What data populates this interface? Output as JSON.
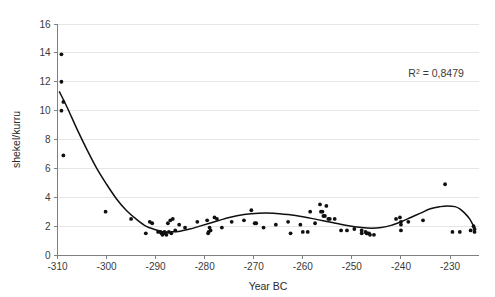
{
  "chart_data": {
    "type": "scatter",
    "title": "",
    "xlabel": "Year BC",
    "ylabel": "shekel/kurru",
    "xlim": [
      -312,
      -224
    ],
    "ylim": [
      0,
      16
    ],
    "grid": true,
    "legend": false,
    "xticks": [
      -310,
      -300,
      -290,
      -280,
      -270,
      -260,
      -250,
      -240,
      -230
    ],
    "xtick_labels": [
      "-310",
      "-300",
      "-290",
      "-280",
      "-270",
      "-260",
      "-250",
      "-240",
      "-230"
    ],
    "yticks": [
      0,
      2,
      4,
      6,
      8,
      10,
      12,
      14,
      16
    ],
    "ytick_labels": [
      "0",
      "2",
      "4",
      "6",
      "8",
      "10",
      "12",
      "14",
      "16"
    ],
    "annotations": [
      {
        "name": "r-squared-label",
        "prefix": "R",
        "superscript": "2",
        "suffix": " = 0,8479",
        "full_text": "R2 = 0,8479",
        "x": -238.5,
        "y": 12.3
      }
    ],
    "series": [
      {
        "name": "price observations",
        "marker": "circle",
        "color": "#101010",
        "points": [
          [
            -309.2,
            13.9
          ],
          [
            -309.2,
            12.0
          ],
          [
            -308.8,
            10.6
          ],
          [
            -309.2,
            10.0
          ],
          [
            -308.8,
            6.9
          ],
          [
            -300.2,
            3.0
          ],
          [
            -295.0,
            2.5
          ],
          [
            -292.0,
            1.5
          ],
          [
            -291.2,
            2.3
          ],
          [
            -290.7,
            2.2
          ],
          [
            -289.5,
            1.6
          ],
          [
            -289.0,
            1.6
          ],
          [
            -288.8,
            1.5
          ],
          [
            -288.6,
            1.4
          ],
          [
            -288.4,
            1.5
          ],
          [
            -288.2,
            1.6
          ],
          [
            -288.0,
            1.5
          ],
          [
            -287.8,
            1.4
          ],
          [
            -287.5,
            2.2
          ],
          [
            -287.3,
            1.6
          ],
          [
            -287.0,
            2.4
          ],
          [
            -286.8,
            1.5
          ],
          [
            -286.5,
            2.5
          ],
          [
            -286.0,
            1.7
          ],
          [
            -285.2,
            2.1
          ],
          [
            -284.0,
            1.9
          ],
          [
            -281.5,
            2.3
          ],
          [
            -279.5,
            2.4
          ],
          [
            -279.3,
            1.5
          ],
          [
            -279.2,
            1.6
          ],
          [
            -279.0,
            1.9
          ],
          [
            -278.8,
            1.7
          ],
          [
            -278.0,
            2.6
          ],
          [
            -277.5,
            2.5
          ],
          [
            -276.5,
            1.9
          ],
          [
            -274.5,
            2.3
          ],
          [
            -272.0,
            2.4
          ],
          [
            -270.5,
            3.1
          ],
          [
            -269.8,
            2.2
          ],
          [
            -269.5,
            2.2
          ],
          [
            -268.0,
            1.9
          ],
          [
            -265.5,
            2.1
          ],
          [
            -263.0,
            2.3
          ],
          [
            -262.5,
            1.5
          ],
          [
            -260.5,
            2.1
          ],
          [
            -260.0,
            1.6
          ],
          [
            -259.0,
            1.6
          ],
          [
            -258.5,
            3.0
          ],
          [
            -257.5,
            2.2
          ],
          [
            -256.5,
            3.5
          ],
          [
            -256.3,
            3.0
          ],
          [
            -256.0,
            3.0
          ],
          [
            -255.8,
            2.7
          ],
          [
            -255.5,
            2.7
          ],
          [
            -255.2,
            3.4
          ],
          [
            -254.8,
            2.5
          ],
          [
            -254.5,
            2.5
          ],
          [
            -253.5,
            2.5
          ],
          [
            -252.2,
            1.7
          ],
          [
            -251.0,
            1.7
          ],
          [
            -249.5,
            1.8
          ],
          [
            -248.0,
            1.7
          ],
          [
            -248.0,
            1.5
          ],
          [
            -247.2,
            1.6
          ],
          [
            -247.0,
            1.5
          ],
          [
            -246.8,
            1.5
          ],
          [
            -246.5,
            1.5
          ],
          [
            -246.3,
            1.4
          ],
          [
            -245.5,
            1.4
          ],
          [
            -241.0,
            2.5
          ],
          [
            -240.2,
            2.6
          ],
          [
            -240.0,
            2.3
          ],
          [
            -240.0,
            2.1
          ],
          [
            -240.0,
            1.7
          ],
          [
            -238.5,
            2.3
          ],
          [
            -235.5,
            2.4
          ],
          [
            -231.0,
            4.9
          ],
          [
            -229.5,
            1.6
          ],
          [
            -228.0,
            1.6
          ],
          [
            -225.8,
            1.7
          ],
          [
            -225.2,
            2.0
          ],
          [
            -225.0,
            1.8
          ],
          [
            -225.0,
            1.6
          ]
        ]
      }
    ],
    "trendline": {
      "name": "polynomial regression",
      "r_squared": "0,8479",
      "color": "#101010",
      "points": [
        [
          -309.6,
          11.3
        ],
        [
          -308.0,
          10.2
        ],
        [
          -306.0,
          8.7
        ],
        [
          -304.0,
          7.3
        ],
        [
          -302.0,
          6.0
        ],
        [
          -300.0,
          4.9
        ],
        [
          -298.0,
          3.9
        ],
        [
          -296.0,
          3.1
        ],
        [
          -294.0,
          2.5
        ],
        [
          -292.0,
          2.0
        ],
        [
          -290.0,
          1.75
        ],
        [
          -288.5,
          1.6
        ],
        [
          -287.0,
          1.6
        ],
        [
          -285.0,
          1.65
        ],
        [
          -283.0,
          1.8
        ],
        [
          -281.0,
          2.0
        ],
        [
          -279.0,
          2.2
        ],
        [
          -277.0,
          2.4
        ],
        [
          -275.0,
          2.6
        ],
        [
          -272.0,
          2.8
        ],
        [
          -269.0,
          2.9
        ],
        [
          -266.0,
          2.9
        ],
        [
          -263.0,
          2.8
        ],
        [
          -260.0,
          2.65
        ],
        [
          -257.0,
          2.45
        ],
        [
          -254.0,
          2.25
        ],
        [
          -251.0,
          2.05
        ],
        [
          -248.0,
          1.9
        ],
        [
          -246.0,
          1.85
        ],
        [
          -244.0,
          1.9
        ],
        [
          -242.0,
          2.05
        ],
        [
          -240.0,
          2.3
        ],
        [
          -238.0,
          2.6
        ],
        [
          -236.0,
          2.9
        ],
        [
          -234.0,
          3.2
        ],
        [
          -232.0,
          3.35
        ],
        [
          -230.5,
          3.4
        ],
        [
          -229.0,
          3.35
        ],
        [
          -228.0,
          3.2
        ],
        [
          -227.0,
          2.9
        ],
        [
          -226.0,
          2.5
        ],
        [
          -225.2,
          2.0
        ],
        [
          -224.8,
          1.75
        ]
      ]
    }
  }
}
